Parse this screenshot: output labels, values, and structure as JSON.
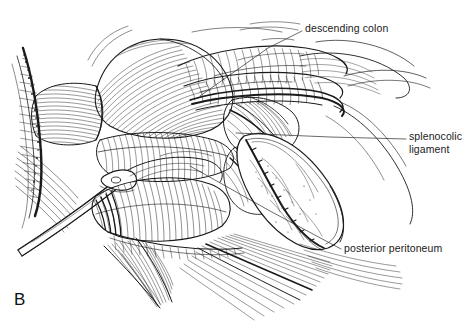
{
  "figure": {
    "panel_letter": "B",
    "kind": "surgical anatomy line drawing",
    "background_color": "#ffffff",
    "ink_color": "#1a1a1a",
    "width": 470,
    "height": 326
  },
  "labels": [
    {
      "id": "descending-colon",
      "text": "descending colon",
      "text_x": 305,
      "text_y": 22,
      "leader": [
        [
          302,
          31
        ],
        [
          268,
          48
        ],
        [
          200,
          96
        ]
      ]
    },
    {
      "id": "splenocolic-ligament",
      "text": "splenocolic\nligament",
      "line1": "splenocolic",
      "line2": "ligament",
      "text_x": 409,
      "text_y": 130,
      "leader": [
        [
          406,
          139
        ],
        [
          330,
          137
        ],
        [
          236,
          133
        ]
      ]
    },
    {
      "id": "posterior-peritoneum",
      "text": "posterior peritoneum",
      "text_x": 344,
      "text_y": 242,
      "leader": [
        [
          341,
          249
        ],
        [
          270,
          211
        ],
        [
          190,
          166
        ]
      ]
    }
  ],
  "anatomy_regions": [
    {
      "name": "descending-colon",
      "note": "tubular bowel segment, upper right, transverse banded hatching"
    },
    {
      "name": "splenocolic-ligament",
      "note": "tissue band at mid-right, between colon and peritoneal flap"
    },
    {
      "name": "posterior-peritoneum",
      "note": "pale reflected membrane flap, right of center, sparse stipple"
    },
    {
      "name": "bowel-loop-mass",
      "note": "rounded loops, upper-left to center, contour hatching"
    },
    {
      "name": "retractor-instrument",
      "note": "metal retractor entering from lower left"
    },
    {
      "name": "cut-tissue-margin",
      "note": "dark stippled band along left edge"
    },
    {
      "name": "fan-fascia-lower-left",
      "note": "fan of converging strokes, lower center-left"
    },
    {
      "name": "fan-fascia-lower-right",
      "note": "fan of converging strokes, lower center-right"
    }
  ]
}
